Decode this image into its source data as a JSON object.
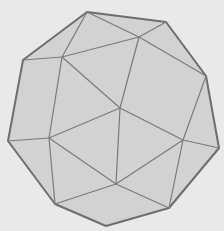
{
  "figure": {
    "type": "polyhedron-projection",
    "colors": {
      "background": "#e9e9e9",
      "fill": "#d2d2d2",
      "edge": "#7a7a7a",
      "outline": "#6e6e6e"
    },
    "vertices": {
      "A": [
        87,
        12
      ],
      "B": [
        166,
        22
      ],
      "C": [
        206,
        76
      ],
      "D": [
        219,
        148
      ],
      "E": [
        169,
        208
      ],
      "F": [
        106,
        226
      ],
      "G": [
        55,
        204
      ],
      "H": [
        8,
        141
      ],
      "I": [
        23,
        60
      ],
      "J": [
        139,
        37
      ],
      "K": [
        62,
        57
      ],
      "L": [
        120,
        108
      ],
      "M": [
        183,
        140
      ],
      "N": [
        49,
        138
      ],
      "O": [
        116,
        184
      ]
    },
    "outline": [
      "A",
      "B",
      "C",
      "D",
      "E",
      "F",
      "G",
      "H",
      "I"
    ],
    "edges": [
      [
        "A",
        "J"
      ],
      [
        "B",
        "J"
      ],
      [
        "J",
        "C"
      ],
      [
        "A",
        "K"
      ],
      [
        "I",
        "K"
      ],
      [
        "K",
        "J"
      ],
      [
        "K",
        "L"
      ],
      [
        "J",
        "L"
      ],
      [
        "C",
        "M"
      ],
      [
        "L",
        "M"
      ],
      [
        "M",
        "D"
      ],
      [
        "M",
        "E"
      ],
      [
        "K",
        "N"
      ],
      [
        "H",
        "N"
      ],
      [
        "N",
        "L"
      ],
      [
        "N",
        "G"
      ],
      [
        "L",
        "O"
      ],
      [
        "N",
        "O"
      ],
      [
        "M",
        "O"
      ],
      [
        "O",
        "G"
      ],
      [
        "O",
        "E"
      ]
    ]
  }
}
